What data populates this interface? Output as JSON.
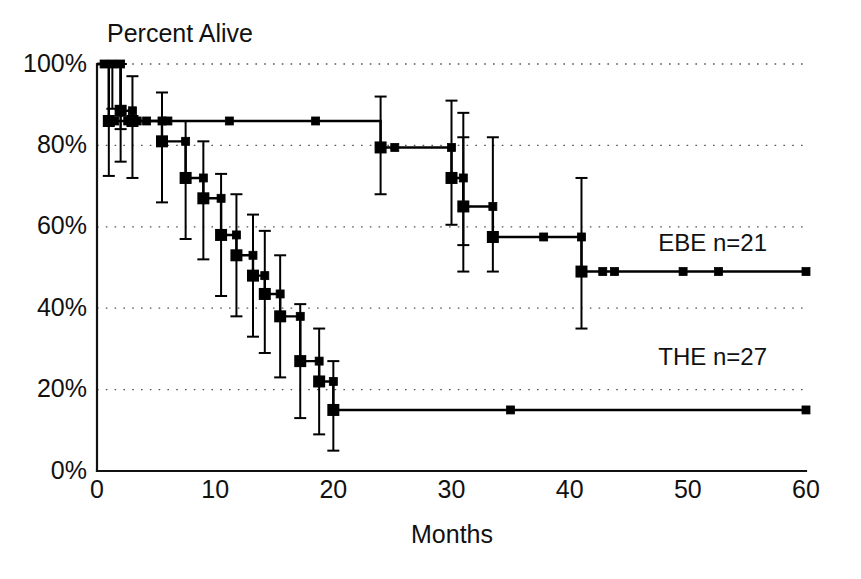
{
  "chart_data": {
    "type": "line",
    "title": "Percent Alive",
    "subtitle": "",
    "xlabel": "Months",
    "ylabel": "Percent Alive",
    "xlim": [
      0,
      60
    ],
    "ylim": [
      0,
      100
    ],
    "xticks": [
      0,
      10,
      20,
      30,
      40,
      50,
      60
    ],
    "xticklabels": [
      "0",
      "10",
      "20",
      "30",
      "40",
      "50",
      "60"
    ],
    "yticks": [
      0,
      20,
      40,
      60,
      80,
      100
    ],
    "yticklabels": [
      "0%",
      "20%",
      "40%",
      "60%",
      "80%",
      "100%"
    ],
    "grid": "horizontal-dotted",
    "legend_position": "right-inline",
    "plot_kind": "kaplan-meier-survival",
    "series": [
      {
        "name": "EBE",
        "label": "EBE  n=21",
        "n": 21,
        "label_x": 47.5,
        "label_y": 55.5,
        "steps": [
          {
            "x": 0,
            "y": 100
          },
          {
            "x": 1.0,
            "y": 100
          },
          {
            "x": 1.0,
            "y": 86
          },
          {
            "x": 6.0,
            "y": 86
          },
          {
            "x": 6.0,
            "y": 86
          },
          {
            "x": 24.0,
            "y": 86
          },
          {
            "x": 24.0,
            "y": 79.5
          },
          {
            "x": 30.0,
            "y": 79.5
          },
          {
            "x": 30.0,
            "y": 72
          },
          {
            "x": 31.0,
            "y": 72
          },
          {
            "x": 31.0,
            "y": 65
          },
          {
            "x": 33.5,
            "y": 65
          },
          {
            "x": 33.5,
            "y": 57.5
          },
          {
            "x": 41.0,
            "y": 57.5
          },
          {
            "x": 41.0,
            "y": 49
          },
          {
            "x": 60.0,
            "y": 49
          }
        ],
        "event_points": [
          {
            "x": 1.0,
            "y": 86
          },
          {
            "x": 24.0,
            "y": 79.5
          },
          {
            "x": 30.0,
            "y": 72
          },
          {
            "x": 31.0,
            "y": 65
          },
          {
            "x": 33.5,
            "y": 57.5
          },
          {
            "x": 41.0,
            "y": 49
          }
        ],
        "censored_points": [
          {
            "x": 1.5,
            "y": 86
          },
          {
            "x": 2.6,
            "y": 86
          },
          {
            "x": 3.4,
            "y": 86
          },
          {
            "x": 4.2,
            "y": 86
          },
          {
            "x": 6.0,
            "y": 86
          },
          {
            "x": 11.2,
            "y": 86
          },
          {
            "x": 18.5,
            "y": 86
          },
          {
            "x": 25.2,
            "y": 79.5
          },
          {
            "x": 30.0,
            "y": 79.5
          },
          {
            "x": 31.0,
            "y": 72
          },
          {
            "x": 33.5,
            "y": 65
          },
          {
            "x": 37.8,
            "y": 57.5
          },
          {
            "x": 41.0,
            "y": 57.5
          },
          {
            "x": 42.8,
            "y": 49
          },
          {
            "x": 43.8,
            "y": 49
          },
          {
            "x": 49.6,
            "y": 49
          },
          {
            "x": 52.6,
            "y": 49
          },
          {
            "x": 60.0,
            "y": 49
          }
        ],
        "error_bars": [
          {
            "x": 1.0,
            "y": 86,
            "lo": 72.5,
            "hi": 100
          },
          {
            "x": 24.0,
            "y": 79.5,
            "lo": 68,
            "hi": 92
          },
          {
            "x": 30.0,
            "y": 79.5,
            "lo": 60.5,
            "hi": 91
          },
          {
            "x": 31.0,
            "y": 72,
            "lo": 55.5,
            "hi": 88
          },
          {
            "x": 33.5,
            "y": 65,
            "lo": 49,
            "hi": 82
          },
          {
            "x": 41.0,
            "y": 57.5,
            "lo": 35,
            "hi": 72
          },
          {
            "x": 31.0,
            "y": 65,
            "lo": 49,
            "hi": 82
          }
        ]
      },
      {
        "name": "THE",
        "label": "THE  n=27",
        "n": 27,
        "label_x": 47.5,
        "label_y": 27.5,
        "steps": [
          {
            "x": 0,
            "y": 100
          },
          {
            "x": 2.0,
            "y": 100
          },
          {
            "x": 2.0,
            "y": 88.5
          },
          {
            "x": 3.0,
            "y": 88.5
          },
          {
            "x": 3.0,
            "y": 86
          },
          {
            "x": 5.5,
            "y": 86
          },
          {
            "x": 5.5,
            "y": 81
          },
          {
            "x": 7.5,
            "y": 81
          },
          {
            "x": 7.5,
            "y": 72
          },
          {
            "x": 9.0,
            "y": 72
          },
          {
            "x": 9.0,
            "y": 67
          },
          {
            "x": 10.5,
            "y": 67
          },
          {
            "x": 10.5,
            "y": 58
          },
          {
            "x": 11.8,
            "y": 58
          },
          {
            "x": 11.8,
            "y": 53
          },
          {
            "x": 13.2,
            "y": 53
          },
          {
            "x": 13.2,
            "y": 48
          },
          {
            "x": 14.2,
            "y": 48
          },
          {
            "x": 14.2,
            "y": 43.5
          },
          {
            "x": 15.5,
            "y": 43.5
          },
          {
            "x": 15.5,
            "y": 38
          },
          {
            "x": 17.2,
            "y": 38
          },
          {
            "x": 17.2,
            "y": 27
          },
          {
            "x": 18.8,
            "y": 27
          },
          {
            "x": 18.8,
            "y": 22
          },
          {
            "x": 20.0,
            "y": 22
          },
          {
            "x": 20.0,
            "y": 15
          },
          {
            "x": 60.0,
            "y": 15
          }
        ],
        "event_points": [
          {
            "x": 2.0,
            "y": 88.5
          },
          {
            "x": 3.0,
            "y": 86
          },
          {
            "x": 5.5,
            "y": 81
          },
          {
            "x": 7.5,
            "y": 72
          },
          {
            "x": 9.0,
            "y": 67
          },
          {
            "x": 10.5,
            "y": 58
          },
          {
            "x": 11.8,
            "y": 53
          },
          {
            "x": 13.2,
            "y": 48
          },
          {
            "x": 14.2,
            "y": 43.5
          },
          {
            "x": 15.5,
            "y": 38
          },
          {
            "x": 17.2,
            "y": 27
          },
          {
            "x": 18.8,
            "y": 22
          },
          {
            "x": 20.0,
            "y": 15
          }
        ],
        "censored_points": [
          {
            "x": 0.6,
            "y": 100
          },
          {
            "x": 1.3,
            "y": 100
          },
          {
            "x": 2.0,
            "y": 100
          },
          {
            "x": 3.0,
            "y": 88.5
          },
          {
            "x": 5.5,
            "y": 86
          },
          {
            "x": 7.5,
            "y": 81
          },
          {
            "x": 9.0,
            "y": 72
          },
          {
            "x": 10.5,
            "y": 67
          },
          {
            "x": 11.8,
            "y": 58
          },
          {
            "x": 13.2,
            "y": 53
          },
          {
            "x": 14.2,
            "y": 48
          },
          {
            "x": 15.5,
            "y": 43.5
          },
          {
            "x": 17.2,
            "y": 38
          },
          {
            "x": 18.8,
            "y": 27
          },
          {
            "x": 20.0,
            "y": 22
          },
          {
            "x": 35.0,
            "y": 15
          },
          {
            "x": 60.0,
            "y": 15
          }
        ],
        "error_bars": [
          {
            "x": 2.0,
            "y": 88.5,
            "lo": 76,
            "hi": 100
          },
          {
            "x": 3.0,
            "y": 86,
            "lo": 72,
            "hi": 97
          },
          {
            "x": 5.5,
            "y": 81,
            "lo": 66,
            "hi": 93
          },
          {
            "x": 7.5,
            "y": 72,
            "lo": 57,
            "hi": 86
          },
          {
            "x": 9.0,
            "y": 67,
            "lo": 52,
            "hi": 81
          },
          {
            "x": 10.5,
            "y": 58,
            "lo": 43,
            "hi": 73
          },
          {
            "x": 11.8,
            "y": 53,
            "lo": 38,
            "hi": 68
          },
          {
            "x": 13.2,
            "y": 48,
            "lo": 33,
            "hi": 63
          },
          {
            "x": 14.2,
            "y": 43.5,
            "lo": 29,
            "hi": 59
          },
          {
            "x": 15.5,
            "y": 38,
            "lo": 23,
            "hi": 53
          },
          {
            "x": 17.2,
            "y": 27,
            "lo": 13,
            "hi": 41
          },
          {
            "x": 18.8,
            "y": 22,
            "lo": 9,
            "hi": 35
          },
          {
            "x": 20.0,
            "y": 15,
            "lo": 5,
            "hi": 27
          },
          {
            "x": 2.0,
            "y": 100,
            "lo": 84,
            "hi": 100
          },
          {
            "x": 1.3,
            "y": 100,
            "lo": 89,
            "hi": 100
          }
        ]
      }
    ]
  },
  "legend": [
    {
      "text": "EBE  n=21"
    },
    {
      "text": "THE  n=27"
    }
  ],
  "axis": {
    "y_title": "Percent Alive",
    "x_title": "Months"
  }
}
